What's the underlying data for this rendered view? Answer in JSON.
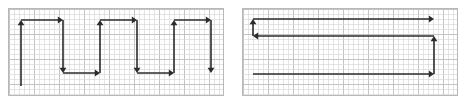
{
  "figure": {
    "width": 465,
    "height": 104,
    "background": "#ffffff",
    "grid": {
      "cell_size": 5,
      "minor_color": "#d9d9d9",
      "major_every": 5,
      "major_color": "#bdbdbd",
      "border_color": "#b8b8b8"
    },
    "stroke": {
      "color": "#2b2b2b",
      "width": 1.6,
      "arrow_color": "#2b2b2b"
    }
  },
  "panels": [
    {
      "name": "boustrophedon-path-panel",
      "label": "left-panel",
      "x": 8,
      "y": 8,
      "width": 216,
      "height": 88,
      "path_type": "zigzag-serpentine",
      "segments": [
        {
          "name": "seg-up-1",
          "x1": 21,
          "y1": 86,
          "x2": 21,
          "y2": 20,
          "arrow": "end"
        },
        {
          "name": "seg-right-1",
          "x1": 21,
          "y1": 20,
          "x2": 63,
          "y2": 20,
          "arrow": "end"
        },
        {
          "name": "seg-down-1",
          "x1": 63,
          "y1": 20,
          "x2": 63,
          "y2": 73,
          "arrow": "end"
        },
        {
          "name": "seg-right-2",
          "x1": 63,
          "y1": 73,
          "x2": 100,
          "y2": 73,
          "arrow": "end"
        },
        {
          "name": "seg-up-2",
          "x1": 100,
          "y1": 73,
          "x2": 100,
          "y2": 20,
          "arrow": "end"
        },
        {
          "name": "seg-right-3",
          "x1": 100,
          "y1": 20,
          "x2": 137,
          "y2": 20,
          "arrow": "end"
        },
        {
          "name": "seg-down-2",
          "x1": 137,
          "y1": 20,
          "x2": 137,
          "y2": 73,
          "arrow": "end"
        },
        {
          "name": "seg-right-4",
          "x1": 137,
          "y1": 73,
          "x2": 174,
          "y2": 73,
          "arrow": "end"
        },
        {
          "name": "seg-up-3",
          "x1": 174,
          "y1": 73,
          "x2": 174,
          "y2": 20,
          "arrow": "end"
        },
        {
          "name": "seg-right-5",
          "x1": 174,
          "y1": 20,
          "x2": 211,
          "y2": 20,
          "arrow": "end"
        },
        {
          "name": "seg-down-3",
          "x1": 211,
          "y1": 20,
          "x2": 211,
          "y2": 73,
          "arrow": "end"
        }
      ]
    },
    {
      "name": "spiral-path-panel",
      "label": "right-panel",
      "x": 242,
      "y": 8,
      "width": 216,
      "height": 88,
      "path_type": "long-sweep-return",
      "segments": [
        {
          "name": "seg-right-top",
          "x1": 253,
          "y1": 19,
          "x2": 434,
          "y2": 19,
          "arrow": "end"
        },
        {
          "name": "seg-up-left",
          "x1": 253,
          "y1": 36,
          "x2": 253,
          "y2": 19,
          "arrow": "end"
        },
        {
          "name": "seg-left-second",
          "x1": 434,
          "y1": 36,
          "x2": 253,
          "y2": 36,
          "arrow": "end"
        },
        {
          "name": "seg-up-right",
          "x1": 434,
          "y1": 74,
          "x2": 434,
          "y2": 36,
          "arrow": "end"
        },
        {
          "name": "seg-right-bottom",
          "x1": 253,
          "y1": 74,
          "x2": 434,
          "y2": 74,
          "arrow": "end"
        }
      ]
    }
  ]
}
